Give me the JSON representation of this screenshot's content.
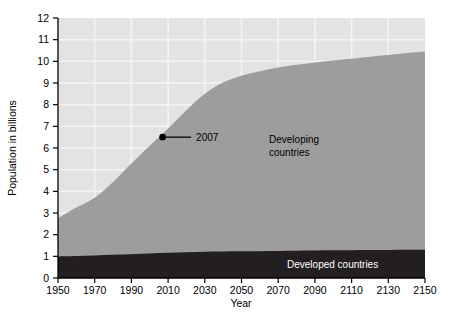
{
  "chart_data": {
    "type": "area",
    "title": "",
    "xlabel": "Year",
    "ylabel": "Population in billions",
    "xlim": [
      1950,
      2150
    ],
    "ylim": [
      0,
      12
    ],
    "xticks": [
      "1950",
      "1970",
      "1990",
      "2010",
      "2030",
      "2050",
      "2070",
      "2090",
      "2110",
      "2130",
      "2150"
    ],
    "yticks": [
      "0",
      "1",
      "2",
      "3",
      "4",
      "5",
      "6",
      "7",
      "8",
      "9",
      "10",
      "11",
      "12"
    ],
    "grid": true,
    "legend_position": "inline-labels",
    "stacked": true,
    "x": [
      1950,
      1960,
      1970,
      1980,
      1990,
      2000,
      2010,
      2020,
      2030,
      2040,
      2050,
      2060,
      2070,
      2080,
      2090,
      2100,
      2110,
      2120,
      2130,
      2140,
      2150
    ],
    "series": [
      {
        "name": "Developed countries",
        "color": "#231f20",
        "values": [
          0.99,
          1.01,
          1.04,
          1.07,
          1.1,
          1.13,
          1.16,
          1.19,
          1.21,
          1.22,
          1.23,
          1.24,
          1.25,
          1.26,
          1.27,
          1.28,
          1.28,
          1.29,
          1.29,
          1.3,
          1.3
        ]
      },
      {
        "name": "Developing countries",
        "color": "#9d9d9d",
        "values": [
          1.77,
          2.24,
          2.66,
          3.36,
          4.18,
          4.97,
          5.74,
          6.55,
          7.29,
          7.8,
          8.1,
          8.3,
          8.46,
          8.58,
          8.68,
          8.76,
          8.84,
          8.92,
          9.0,
          9.08,
          9.15
        ]
      }
    ],
    "totals": [
      2.76,
      3.25,
      3.7,
      4.43,
      5.28,
      6.1,
      6.9,
      7.74,
      8.5,
      9.02,
      9.33,
      9.54,
      9.71,
      9.84,
      9.95,
      10.04,
      10.12,
      10.21,
      10.29,
      10.38,
      10.45
    ],
    "annotations": [
      {
        "label": "2007",
        "x": 2007,
        "y": 6.5,
        "marker": "dot"
      }
    ]
  },
  "axes": {
    "y_title": "Population in billions",
    "x_title": "Year",
    "y_tick_labels": [
      "12",
      "11",
      "10",
      "9",
      "8",
      "7",
      "6",
      "5",
      "4",
      "3",
      "2",
      "1",
      "0"
    ],
    "x_tick_labels": [
      "1950",
      "1970",
      "1990",
      "2010",
      "2030",
      "2050",
      "2070",
      "2090",
      "2110",
      "2130",
      "2150"
    ]
  },
  "labels": {
    "developing_line1": "Developing",
    "developing_line2": "countries",
    "developed": "Developed countries",
    "annotation_2007": "2007"
  },
  "colors": {
    "plot_background": "#e3e3e3",
    "gridline": "#f2f2f2",
    "developing_area": "#9d9d9d",
    "developed_area": "#231f20",
    "axis": "#000000"
  }
}
